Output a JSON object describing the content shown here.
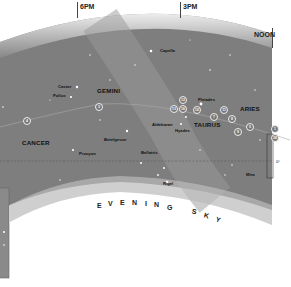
{
  "time_markers": [
    {
      "label": "6PM",
      "x": 80,
      "y": 3
    },
    {
      "label": "3PM",
      "x": 183,
      "y": 3
    },
    {
      "label": "NOON",
      "x": 256,
      "y": 31
    }
  ],
  "constellations": [
    {
      "name": "GEMINI",
      "x": 97,
      "y": 87
    },
    {
      "name": "CANCER",
      "x": 22,
      "y": 139
    },
    {
      "name": "TAURUS",
      "x": 194,
      "y": 123
    },
    {
      "name": "ARIES",
      "x": 240,
      "y": 105
    }
  ],
  "stars": [
    {
      "name": "Capella",
      "x": 158,
      "y": 49
    },
    {
      "name": "Castor",
      "x": 60,
      "y": 84
    },
    {
      "name": "Pollux",
      "x": 54,
      "y": 93
    },
    {
      "name": "Pleiades",
      "x": 197,
      "y": 97
    },
    {
      "name": "Aldebaran",
      "x": 152,
      "y": 123
    },
    {
      "name": "Hyades",
      "x": 175,
      "y": 129
    },
    {
      "name": "Betelgeuse",
      "x": 104,
      "y": 138
    },
    {
      "name": "Procyon",
      "x": 78,
      "y": 150
    },
    {
      "name": "Bellatrix",
      "x": 141,
      "y": 151
    },
    {
      "name": "Rigel",
      "x": 160,
      "y": 182
    },
    {
      "name": "Mira",
      "x": 246,
      "y": 172
    }
  ],
  "moon_positions": [
    {
      "day": "4",
      "x": 24,
      "y": 117
    },
    {
      "day": "3",
      "x": 95,
      "y": 103
    },
    {
      "day": "12",
      "x": 179,
      "y": 96
    },
    {
      "day": "13",
      "x": 170,
      "y": 105
    },
    {
      "day": "16",
      "x": 179,
      "y": 105
    },
    {
      "day": "10",
      "x": 193,
      "y": 106
    },
    {
      "day": "11",
      "x": 220,
      "y": 106
    },
    {
      "day": "7",
      "x": 210,
      "y": 113
    },
    {
      "day": "8",
      "x": 228,
      "y": 115
    },
    {
      "day": "5",
      "x": 246,
      "y": 123
    },
    {
      "day": "9",
      "x": 234,
      "y": 128
    },
    {
      "day": "1",
      "x": 272,
      "y": 125
    },
    {
      "day": "28",
      "x": 272,
      "y": 134
    }
  ],
  "equator_label": "0°",
  "title_arc": {
    "letters": [
      "E",
      "V",
      "E",
      "N",
      "I",
      "N",
      "G",
      " ",
      "S",
      "K",
      "Y"
    ]
  }
}
